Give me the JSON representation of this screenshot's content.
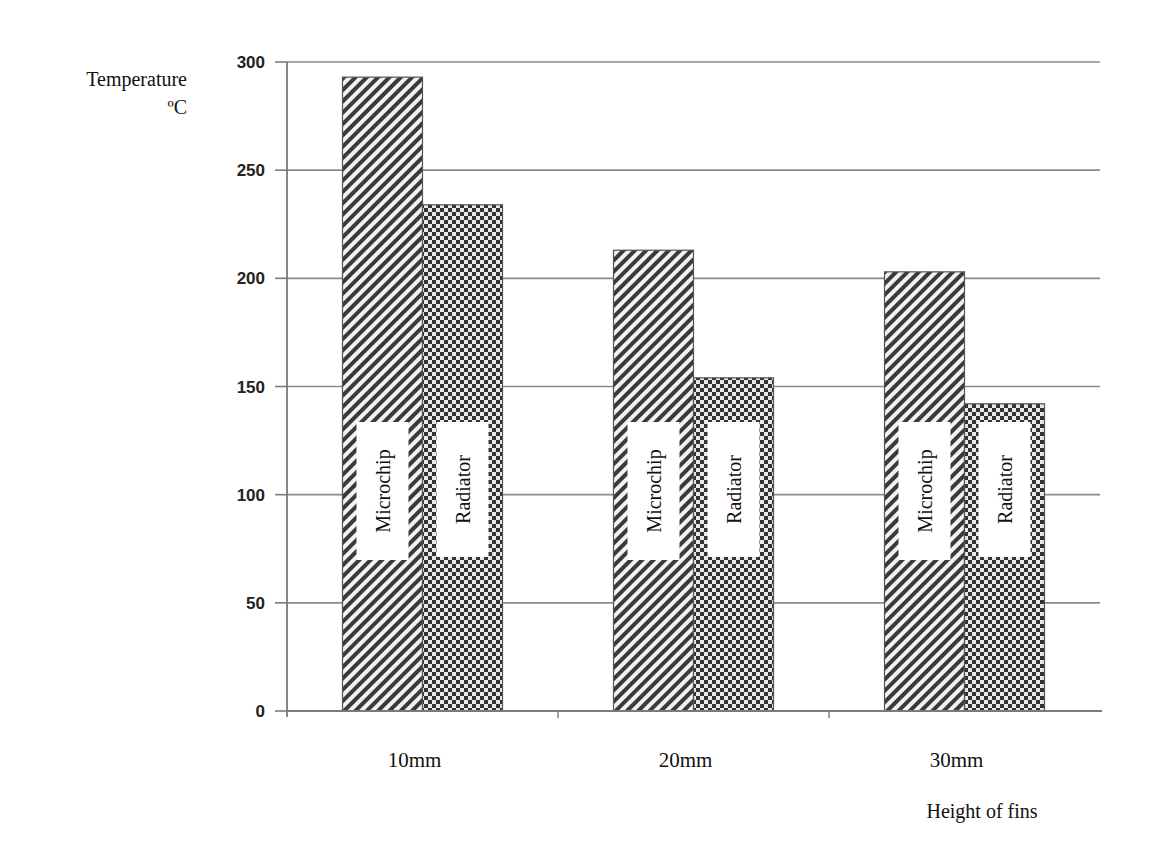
{
  "chart_data": {
    "type": "bar",
    "title": "",
    "xlabel": "Height of fins",
    "ylabel": "Temperature ºC",
    "ylabel_lines": [
      "Temperature",
      "ºC"
    ],
    "categories": [
      "10mm",
      "20mm",
      "30mm"
    ],
    "series": [
      {
        "name": "Microchip",
        "pattern": "diagonal-hatch",
        "values": [
          293,
          213,
          203
        ]
      },
      {
        "name": "Radiator",
        "pattern": "checkerboard",
        "values": [
          234,
          154,
          142
        ]
      }
    ],
    "ylim": [
      0,
      300
    ],
    "yticks": [
      0,
      50,
      100,
      150,
      200,
      250,
      300
    ],
    "grid": true,
    "legend_position": "inline-on-bars",
    "colors": {
      "bar_ink": "#333333",
      "grid": "#8a8a8a",
      "axis": "#7a7a7a"
    }
  }
}
